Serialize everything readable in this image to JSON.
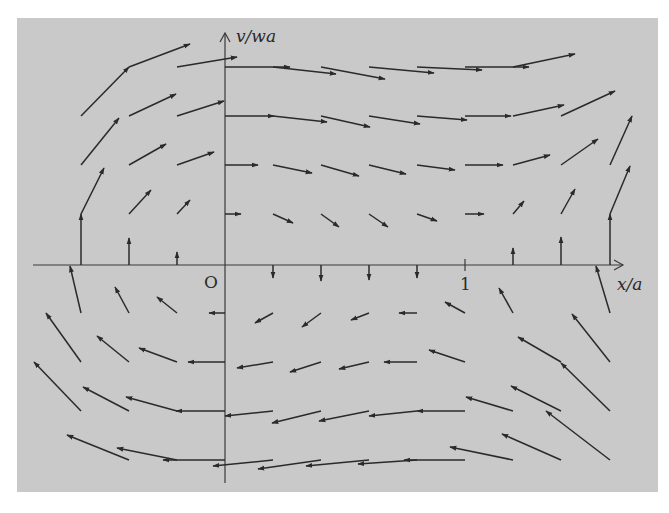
{
  "figure": {
    "background": "#c9c9c9",
    "ink": "#2a2a2a",
    "axes": {
      "x_label": "x/a",
      "y_label": "v/wa",
      "origin_label": "O",
      "x_tick_label": "1",
      "origin_px": [
        225,
        265
      ],
      "x_tick_px": 465,
      "x_axis_px": [
        33,
        623
      ],
      "y_axis_px": [
        33,
        483
      ]
    },
    "arrows": [
      {
        "x1": 81,
        "y1": 116,
        "x2": 129,
        "y2": 67
      },
      {
        "x1": 129,
        "y1": 67,
        "x2": 190,
        "y2": 44
      },
      {
        "x1": 177,
        "y1": 67,
        "x2": 237,
        "y2": 57
      },
      {
        "x1": 81,
        "y1": 165,
        "x2": 119,
        "y2": 118
      },
      {
        "x1": 129,
        "y1": 116,
        "x2": 176,
        "y2": 94
      },
      {
        "x1": 177,
        "y1": 116,
        "x2": 224,
        "y2": 101
      },
      {
        "x1": 81,
        "y1": 214,
        "x2": 104,
        "y2": 168
      },
      {
        "x1": 129,
        "y1": 165,
        "x2": 166,
        "y2": 144
      },
      {
        "x1": 177,
        "y1": 165,
        "x2": 214,
        "y2": 152
      },
      {
        "x1": 129,
        "y1": 214,
        "x2": 151,
        "y2": 190
      },
      {
        "x1": 177,
        "y1": 214,
        "x2": 190,
        "y2": 200
      },
      {
        "x1": 81,
        "y1": 265,
        "x2": 81,
        "y2": 214
      },
      {
        "x1": 129,
        "y1": 265,
        "x2": 129,
        "y2": 238
      },
      {
        "x1": 177,
        "y1": 265,
        "x2": 177,
        "y2": 252
      },
      {
        "x1": 225,
        "y1": 67,
        "x2": 290,
        "y2": 67
      },
      {
        "x1": 273,
        "y1": 67,
        "x2": 336,
        "y2": 74
      },
      {
        "x1": 321,
        "y1": 67,
        "x2": 385,
        "y2": 79
      },
      {
        "x1": 369,
        "y1": 67,
        "x2": 434,
        "y2": 73
      },
      {
        "x1": 417,
        "y1": 67,
        "x2": 482,
        "y2": 70
      },
      {
        "x1": 465,
        "y1": 67,
        "x2": 529,
        "y2": 67
      },
      {
        "x1": 513,
        "y1": 67,
        "x2": 575,
        "y2": 54
      },
      {
        "x1": 225,
        "y1": 116,
        "x2": 274,
        "y2": 116
      },
      {
        "x1": 273,
        "y1": 116,
        "x2": 327,
        "y2": 122
      },
      {
        "x1": 321,
        "y1": 116,
        "x2": 370,
        "y2": 127
      },
      {
        "x1": 369,
        "y1": 116,
        "x2": 420,
        "y2": 124
      },
      {
        "x1": 417,
        "y1": 116,
        "x2": 467,
        "y2": 120
      },
      {
        "x1": 465,
        "y1": 116,
        "x2": 511,
        "y2": 116
      },
      {
        "x1": 513,
        "y1": 116,
        "x2": 564,
        "y2": 105
      },
      {
        "x1": 561,
        "y1": 116,
        "x2": 615,
        "y2": 91
      },
      {
        "x1": 225,
        "y1": 165,
        "x2": 258,
        "y2": 165
      },
      {
        "x1": 273,
        "y1": 165,
        "x2": 312,
        "y2": 173
      },
      {
        "x1": 321,
        "y1": 165,
        "x2": 359,
        "y2": 176
      },
      {
        "x1": 369,
        "y1": 165,
        "x2": 406,
        "y2": 174
      },
      {
        "x1": 417,
        "y1": 165,
        "x2": 455,
        "y2": 170
      },
      {
        "x1": 465,
        "y1": 165,
        "x2": 503,
        "y2": 165
      },
      {
        "x1": 513,
        "y1": 165,
        "x2": 550,
        "y2": 155
      },
      {
        "x1": 561,
        "y1": 165,
        "x2": 598,
        "y2": 139
      },
      {
        "x1": 610,
        "y1": 165,
        "x2": 632,
        "y2": 116
      },
      {
        "x1": 225,
        "y1": 214,
        "x2": 241,
        "y2": 214
      },
      {
        "x1": 273,
        "y1": 214,
        "x2": 293,
        "y2": 223
      },
      {
        "x1": 321,
        "y1": 214,
        "x2": 339,
        "y2": 227
      },
      {
        "x1": 369,
        "y1": 214,
        "x2": 388,
        "y2": 227
      },
      {
        "x1": 417,
        "y1": 214,
        "x2": 437,
        "y2": 221
      },
      {
        "x1": 465,
        "y1": 214,
        "x2": 484,
        "y2": 214
      },
      {
        "x1": 513,
        "y1": 214,
        "x2": 524,
        "y2": 201
      },
      {
        "x1": 561,
        "y1": 214,
        "x2": 575,
        "y2": 189
      },
      {
        "x1": 610,
        "y1": 214,
        "x2": 630,
        "y2": 166
      },
      {
        "x1": 513,
        "y1": 265,
        "x2": 513,
        "y2": 248
      },
      {
        "x1": 561,
        "y1": 265,
        "x2": 561,
        "y2": 237
      },
      {
        "x1": 610,
        "y1": 265,
        "x2": 610,
        "y2": 214
      },
      {
        "x1": 273,
        "y1": 265,
        "x2": 273,
        "y2": 278
      },
      {
        "x1": 321,
        "y1": 265,
        "x2": 321,
        "y2": 281
      },
      {
        "x1": 369,
        "y1": 265,
        "x2": 369,
        "y2": 280
      },
      {
        "x1": 417,
        "y1": 265,
        "x2": 417,
        "y2": 278
      },
      {
        "x1": 81,
        "y1": 313,
        "x2": 70,
        "y2": 266
      },
      {
        "x1": 129,
        "y1": 313,
        "x2": 115,
        "y2": 287
      },
      {
        "x1": 177,
        "y1": 313,
        "x2": 157,
        "y2": 297
      },
      {
        "x1": 225,
        "y1": 313,
        "x2": 209,
        "y2": 313
      },
      {
        "x1": 273,
        "y1": 313,
        "x2": 255,
        "y2": 323
      },
      {
        "x1": 321,
        "y1": 313,
        "x2": 302,
        "y2": 327
      },
      {
        "x1": 369,
        "y1": 313,
        "x2": 351,
        "y2": 320
      },
      {
        "x1": 417,
        "y1": 313,
        "x2": 399,
        "y2": 313
      },
      {
        "x1": 465,
        "y1": 313,
        "x2": 445,
        "y2": 302
      },
      {
        "x1": 513,
        "y1": 313,
        "x2": 499,
        "y2": 288
      },
      {
        "x1": 610,
        "y1": 313,
        "x2": 596,
        "y2": 266
      },
      {
        "x1": 81,
        "y1": 362,
        "x2": 46,
        "y2": 313
      },
      {
        "x1": 129,
        "y1": 362,
        "x2": 97,
        "y2": 336
      },
      {
        "x1": 177,
        "y1": 362,
        "x2": 139,
        "y2": 348
      },
      {
        "x1": 225,
        "y1": 362,
        "x2": 188,
        "y2": 362
      },
      {
        "x1": 273,
        "y1": 362,
        "x2": 237,
        "y2": 368
      },
      {
        "x1": 321,
        "y1": 362,
        "x2": 290,
        "y2": 372
      },
      {
        "x1": 369,
        "y1": 362,
        "x2": 339,
        "y2": 369
      },
      {
        "x1": 417,
        "y1": 362,
        "x2": 384,
        "y2": 362
      },
      {
        "x1": 465,
        "y1": 362,
        "x2": 429,
        "y2": 350
      },
      {
        "x1": 561,
        "y1": 362,
        "x2": 518,
        "y2": 337
      },
      {
        "x1": 610,
        "y1": 362,
        "x2": 572,
        "y2": 314
      },
      {
        "x1": 81,
        "y1": 411,
        "x2": 34,
        "y2": 362
      },
      {
        "x1": 129,
        "y1": 411,
        "x2": 83,
        "y2": 387
      },
      {
        "x1": 177,
        "y1": 411,
        "x2": 126,
        "y2": 397
      },
      {
        "x1": 225,
        "y1": 411,
        "x2": 176,
        "y2": 411
      },
      {
        "x1": 273,
        "y1": 411,
        "x2": 225,
        "y2": 416
      },
      {
        "x1": 321,
        "y1": 411,
        "x2": 272,
        "y2": 423
      },
      {
        "x1": 369,
        "y1": 411,
        "x2": 319,
        "y2": 421
      },
      {
        "x1": 417,
        "y1": 411,
        "x2": 369,
        "y2": 416
      },
      {
        "x1": 465,
        "y1": 411,
        "x2": 417,
        "y2": 411
      },
      {
        "x1": 513,
        "y1": 411,
        "x2": 466,
        "y2": 397
      },
      {
        "x1": 561,
        "y1": 411,
        "x2": 511,
        "y2": 386
      },
      {
        "x1": 610,
        "y1": 411,
        "x2": 561,
        "y2": 363
      },
      {
        "x1": 129,
        "y1": 460,
        "x2": 67,
        "y2": 435
      },
      {
        "x1": 177,
        "y1": 460,
        "x2": 117,
        "y2": 448
      },
      {
        "x1": 225,
        "y1": 460,
        "x2": 163,
        "y2": 460
      },
      {
        "x1": 273,
        "y1": 460,
        "x2": 213,
        "y2": 466
      },
      {
        "x1": 321,
        "y1": 460,
        "x2": 258,
        "y2": 469
      },
      {
        "x1": 369,
        "y1": 460,
        "x2": 306,
        "y2": 466
      },
      {
        "x1": 417,
        "y1": 460,
        "x2": 358,
        "y2": 464
      },
      {
        "x1": 465,
        "y1": 460,
        "x2": 404,
        "y2": 460
      },
      {
        "x1": 513,
        "y1": 460,
        "x2": 450,
        "y2": 447
      },
      {
        "x1": 561,
        "y1": 460,
        "x2": 502,
        "y2": 434
      },
      {
        "x1": 610,
        "y1": 460,
        "x2": 546,
        "y2": 411
      }
    ]
  }
}
